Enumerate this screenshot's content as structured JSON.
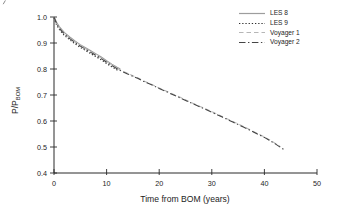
{
  "chart_data": {
    "type": "line",
    "title": "",
    "xlabel": "Time from BOM (years)",
    "ylabel_main": "P/P",
    "ylabel_sub": "BOM",
    "xlim": [
      0,
      50
    ],
    "ylim": [
      0.4,
      1.0
    ],
    "xticks": [
      0,
      10,
      20,
      30,
      40,
      50
    ],
    "xticklabels": [
      "0",
      "10",
      "20",
      "30",
      "40",
      "50"
    ],
    "yticks": [
      1.0,
      0.9,
      0.8,
      0.7,
      0.6,
      0.5,
      0.4
    ],
    "yticklabels": [
      "1.0",
      "0.9",
      "0.8",
      "0.7",
      "0.6",
      "0.5",
      "0.4"
    ],
    "grid": false,
    "legend_position": "top-right",
    "series": [
      {
        "name": "LES 8",
        "style": "solid",
        "color": "#9d9d9d",
        "x": [
          0,
          0.5,
          1,
          1.5,
          2,
          3,
          4,
          5,
          6,
          7,
          8,
          9,
          10,
          11,
          12,
          12.6
        ],
        "y": [
          1.0,
          0.98,
          0.963,
          0.951,
          0.94,
          0.923,
          0.908,
          0.894,
          0.882,
          0.87,
          0.858,
          0.846,
          0.832,
          0.819,
          0.807,
          0.8
        ]
      },
      {
        "name": "LES 9",
        "style": "dotted",
        "color": "#2e2e2e",
        "x": [
          0,
          0.5,
          1,
          1.5,
          2,
          3,
          4,
          5,
          6,
          7,
          8,
          9,
          10,
          11,
          12,
          12.3
        ],
        "y": [
          0.998,
          0.969,
          0.952,
          0.94,
          0.929,
          0.912,
          0.897,
          0.883,
          0.871,
          0.859,
          0.847,
          0.835,
          0.821,
          0.808,
          0.796,
          0.792
        ]
      },
      {
        "name": "Voyager 1",
        "style": "dashed",
        "color": "#b6b6b6",
        "x": [
          0,
          0.5,
          1,
          1.5,
          2,
          3,
          4,
          5,
          6,
          7,
          8,
          9,
          10,
          11,
          12,
          13,
          14,
          15,
          16,
          17,
          18,
          19,
          20,
          22,
          24,
          26,
          28,
          30,
          32,
          34,
          36,
          38,
          40,
          42,
          43
        ],
        "y": [
          1.0,
          0.976,
          0.959,
          0.947,
          0.936,
          0.919,
          0.904,
          0.89,
          0.878,
          0.866,
          0.854,
          0.842,
          0.828,
          0.815,
          0.803,
          0.792,
          0.783,
          0.774,
          0.765,
          0.755,
          0.746,
          0.737,
          0.727,
          0.709,
          0.691,
          0.672,
          0.654,
          0.636,
          0.617,
          0.598,
          0.579,
          0.559,
          0.539,
          0.515,
          0.501
        ]
      },
      {
        "name": "Voyager 2",
        "style": "dashdot",
        "color": "#454545",
        "x": [
          0,
          0.5,
          1,
          1.5,
          2,
          3,
          4,
          5,
          6,
          7,
          8,
          9,
          10,
          11,
          12,
          13,
          14,
          15,
          16,
          17,
          18,
          19,
          20,
          22,
          24,
          26,
          28,
          30,
          32,
          34,
          36,
          38,
          40,
          42,
          43.7
        ],
        "y": [
          1.0,
          0.974,
          0.957,
          0.945,
          0.934,
          0.917,
          0.902,
          0.888,
          0.876,
          0.864,
          0.852,
          0.84,
          0.826,
          0.813,
          0.801,
          0.79,
          0.781,
          0.772,
          0.763,
          0.753,
          0.744,
          0.735,
          0.725,
          0.707,
          0.689,
          0.67,
          0.652,
          0.634,
          0.615,
          0.596,
          0.577,
          0.557,
          0.537,
          0.513,
          0.49
        ]
      }
    ]
  }
}
